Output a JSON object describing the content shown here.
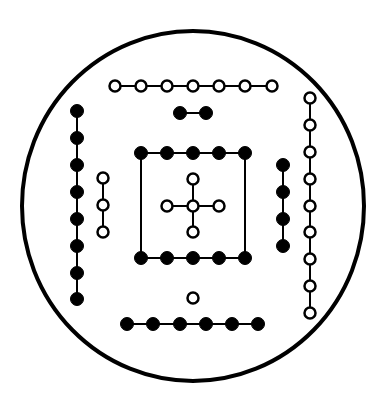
{
  "diagram": {
    "title": "",
    "colors": {
      "stroke": "#000000",
      "filled": "#000000",
      "open": "#ffffff",
      "background": "#ffffff"
    },
    "border_circle": {
      "cx": 193,
      "cy": 206,
      "rx": 171,
      "ry": 175,
      "stroke_width": 4
    },
    "dot_radius": 6.5,
    "groups": [
      {
        "name": "top-open-7",
        "kind": "open",
        "count": 7,
        "connected": true,
        "points": [
          [
            115,
            86
          ],
          [
            141,
            86
          ],
          [
            167,
            86
          ],
          [
            193,
            86
          ],
          [
            219,
            86
          ],
          [
            245,
            86
          ],
          [
            272,
            86
          ]
        ]
      },
      {
        "name": "top-filled-2",
        "kind": "filled",
        "count": 2,
        "connected": true,
        "points": [
          [
            180,
            113
          ],
          [
            206,
            113
          ]
        ]
      },
      {
        "name": "left-filled-8",
        "kind": "filled",
        "count": 8,
        "connected": true,
        "points": [
          [
            77,
            111
          ],
          [
            77,
            138
          ],
          [
            77,
            165
          ],
          [
            77,
            192
          ],
          [
            77,
            219
          ],
          [
            77,
            246
          ],
          [
            77,
            273
          ],
          [
            77,
            299
          ]
        ]
      },
      {
        "name": "left-open-3",
        "kind": "open",
        "count": 3,
        "connected": true,
        "points": [
          [
            103,
            178
          ],
          [
            103,
            205
          ],
          [
            103,
            232
          ]
        ]
      },
      {
        "name": "center-square-top-filled-5",
        "kind": "filled",
        "count": 5,
        "connected": true,
        "points": [
          [
            141,
            153
          ],
          [
            167,
            153
          ],
          [
            193,
            153
          ],
          [
            219,
            153
          ],
          [
            245,
            153
          ]
        ]
      },
      {
        "name": "center-square-bottom-filled-5",
        "kind": "filled",
        "count": 5,
        "connected": true,
        "points": [
          [
            141,
            258
          ],
          [
            167,
            258
          ],
          [
            193,
            258
          ],
          [
            219,
            258
          ],
          [
            245,
            258
          ]
        ]
      },
      {
        "name": "center-cross-open-5",
        "kind": "open",
        "count": 5,
        "connected": "cross",
        "points": [
          [
            193,
            179
          ],
          [
            167,
            206
          ],
          [
            193,
            206
          ],
          [
            219,
            206
          ],
          [
            193,
            232
          ]
        ]
      },
      {
        "name": "right-filled-4",
        "kind": "filled",
        "count": 4,
        "connected": true,
        "points": [
          [
            283,
            165
          ],
          [
            283,
            192
          ],
          [
            283,
            219
          ],
          [
            283,
            246
          ]
        ]
      },
      {
        "name": "right-open-9",
        "kind": "open",
        "count": 9,
        "connected": true,
        "points": [
          [
            310,
            98
          ],
          [
            310,
            125
          ],
          [
            310,
            152
          ],
          [
            310,
            179
          ],
          [
            310,
            206
          ],
          [
            310,
            232
          ],
          [
            310,
            259
          ],
          [
            310,
            286
          ],
          [
            310,
            313
          ]
        ]
      },
      {
        "name": "bottom-open-1",
        "kind": "open",
        "count": 1,
        "connected": false,
        "points": [
          [
            193,
            298
          ]
        ]
      },
      {
        "name": "bottom-filled-6",
        "kind": "filled",
        "count": 6,
        "connected": true,
        "points": [
          [
            127,
            324
          ],
          [
            153,
            324
          ],
          [
            180,
            324
          ],
          [
            206,
            324
          ],
          [
            232,
            324
          ],
          [
            258,
            324
          ]
        ]
      }
    ],
    "square_sides": [
      [
        [
          141,
          153
        ],
        [
          141,
          258
        ]
      ],
      [
        [
          245,
          153
        ],
        [
          245,
          258
        ]
      ]
    ],
    "cross_lines": [
      [
        [
          193,
          179
        ],
        [
          193,
          232
        ]
      ],
      [
        [
          167,
          206
        ],
        [
          219,
          206
        ]
      ]
    ]
  }
}
